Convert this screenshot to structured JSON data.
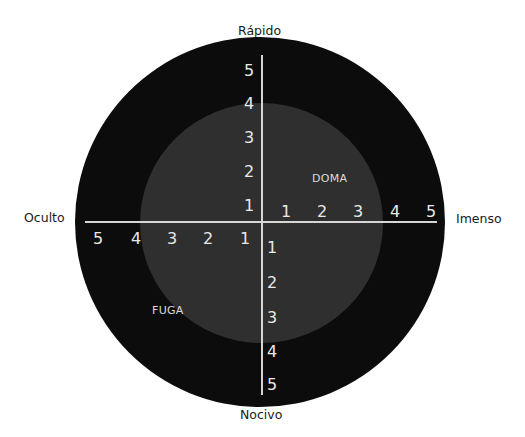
{
  "diagram": {
    "colors": {
      "background": "#ffffff",
      "outer_circle": "#0c0c0c",
      "inner_circle": "#2f2f2f",
      "axis_lines": "#d6d6d6",
      "tick_text": "#e8e8e8",
      "pole_text": "#1a1a1a"
    },
    "poles": {
      "top": "Rápido",
      "bottom": "Nocivo",
      "left": "Oculto",
      "right": "Imenso"
    },
    "regions": {
      "upper_right": "DOMA",
      "lower_left": "FUGA"
    },
    "ticks": {
      "up": [
        "1",
        "2",
        "3",
        "4",
        "5"
      ],
      "down": [
        "1",
        "2",
        "3",
        "4",
        "5"
      ],
      "left": [
        "1",
        "2",
        "3",
        "4",
        "5"
      ],
      "right": [
        "1",
        "2",
        "3",
        "4",
        "5"
      ]
    }
  }
}
